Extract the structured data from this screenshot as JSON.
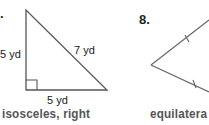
{
  "problems": [
    {
      "number": ".",
      "side_left": "5 yd",
      "hypotenuse": "7 yd",
      "side_bottom": "5 yd",
      "classification": "isosceles, right"
    },
    {
      "number": "8.",
      "classification": "equilatera"
    }
  ],
  "colors": {
    "line": "#555555",
    "text": "#222222",
    "classification": "#555555"
  }
}
